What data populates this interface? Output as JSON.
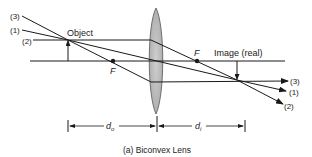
{
  "diagram": {
    "title": "Biconvex Lens",
    "caption": "(a) Biconvex Lens",
    "labels": {
      "object": "Object",
      "image": "Image (real)",
      "focal_left": "F",
      "focal_right": "F",
      "d_object": "d",
      "d_object_sub": "o",
      "d_image": "d",
      "d_image_sub": "i"
    },
    "rays": [
      {
        "id": "3",
        "label": "(3)"
      },
      {
        "id": "1",
        "label": "(1)"
      },
      {
        "id": "2",
        "label": "(2)"
      }
    ],
    "colors": {
      "line": "#1a1a1a",
      "lens_fill": "#bdbdbd",
      "lens_edge": "#555555"
    }
  }
}
